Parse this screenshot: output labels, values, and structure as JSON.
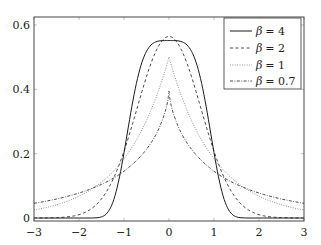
{
  "chart_data": {
    "type": "line",
    "title": "",
    "xlabel": "",
    "ylabel": "",
    "xlim": [
      -3,
      3
    ],
    "ylim": [
      -0.01,
      0.61
    ],
    "grid": false,
    "legend_position": "upper right (inside)",
    "x_ticks": [
      -3,
      -2,
      -1,
      0,
      1,
      2,
      3
    ],
    "x_tick_labels": [
      "−3",
      "−2",
      "−1",
      "0",
      "1",
      "2",
      "3"
    ],
    "y_ticks": [
      0,
      0.2,
      0.4,
      0.6
    ],
    "y_tick_labels": [
      "0",
      "0.2",
      "0.4",
      "0.6"
    ],
    "x": [
      -3.0,
      -2.9,
      -2.8,
      -2.7,
      -2.6,
      -2.5,
      -2.4,
      -2.3,
      -2.2,
      -2.1,
      -2.0,
      -1.9,
      -1.8,
      -1.7,
      -1.6,
      -1.5,
      -1.4,
      -1.3,
      -1.2,
      -1.1,
      -1.0,
      -0.9,
      -0.8,
      -0.7,
      -0.6,
      -0.5,
      -0.4,
      -0.3,
      -0.2,
      -0.1,
      -0.05,
      -0.02,
      0.0,
      0.02,
      0.05,
      0.1,
      0.2,
      0.3,
      0.4,
      0.5,
      0.6,
      0.7,
      0.8,
      0.9,
      1.0,
      1.1,
      1.2,
      1.3,
      1.4,
      1.5,
      1.6,
      1.7,
      1.8,
      1.9,
      2.0,
      2.1,
      2.2,
      2.3,
      2.4,
      2.5,
      2.6,
      2.7,
      2.8,
      2.9,
      3.0
    ],
    "series": [
      {
        "name": "β = 4",
        "legend_symbol": "β",
        "legend_value": "= 4",
        "style": "solid",
        "values": [
          0,
          0,
          0,
          0,
          0,
          0,
          0,
          0,
          0,
          0,
          0,
          0,
          0,
          0.0001,
          0.0008,
          0.0035,
          0.0118,
          0.0317,
          0.0693,
          0.1277,
          0.2029,
          0.2862,
          0.366,
          0.4338,
          0.4846,
          0.5182,
          0.5377,
          0.5471,
          0.5507,
          0.5515,
          0.5516,
          0.5516,
          0.5516,
          0.5516,
          0.5516,
          0.5515,
          0.5507,
          0.5471,
          0.5377,
          0.5182,
          0.4846,
          0.4338,
          0.366,
          0.2862,
          0.2029,
          0.1277,
          0.0693,
          0.0317,
          0.0118,
          0.0035,
          0.0008,
          0.0001,
          0,
          0,
          0,
          0,
          0,
          0,
          0,
          0,
          0,
          0,
          0,
          0,
          0
        ]
      },
      {
        "name": "β = 2",
        "legend_symbol": "β",
        "legend_value": "= 2",
        "style": "dashed",
        "values": [
          0.0001,
          0.0001,
          0.0002,
          0.0004,
          0.0007,
          0.0011,
          0.0018,
          0.0028,
          0.0045,
          0.0068,
          0.0103,
          0.0152,
          0.0221,
          0.0314,
          0.0436,
          0.0595,
          0.0794,
          0.104,
          0.1337,
          0.1682,
          0.2076,
          0.251,
          0.2975,
          0.3455,
          0.3936,
          0.4394,
          0.4808,
          0.5157,
          0.5421,
          0.5586,
          0.5628,
          0.564,
          0.5642,
          0.564,
          0.5628,
          0.5586,
          0.5421,
          0.5157,
          0.4808,
          0.4394,
          0.3936,
          0.3455,
          0.2975,
          0.251,
          0.2076,
          0.1682,
          0.1337,
          0.104,
          0.0794,
          0.0595,
          0.0436,
          0.0314,
          0.0221,
          0.0152,
          0.0103,
          0.0068,
          0.0045,
          0.0028,
          0.0018,
          0.0011,
          0.0007,
          0.0004,
          0.0002,
          0.0001,
          0.0001
        ]
      },
      {
        "name": "β = 1",
        "legend_symbol": "β",
        "legend_value": "= 1",
        "style": "dotted",
        "values": [
          0.0249,
          0.0275,
          0.0304,
          0.0336,
          0.0371,
          0.041,
          0.0454,
          0.0501,
          0.0554,
          0.0612,
          0.0677,
          0.0748,
          0.0826,
          0.0913,
          0.1009,
          0.1116,
          0.1233,
          0.1363,
          0.1506,
          0.1664,
          0.1839,
          0.2033,
          0.2247,
          0.2483,
          0.2744,
          0.3033,
          0.3352,
          0.3704,
          0.4094,
          0.4524,
          0.4756,
          0.4901,
          0.5,
          0.4901,
          0.4756,
          0.4524,
          0.4094,
          0.3704,
          0.3352,
          0.3033,
          0.2744,
          0.2483,
          0.2247,
          0.2033,
          0.1839,
          0.1664,
          0.1506,
          0.1363,
          0.1233,
          0.1116,
          0.1009,
          0.0913,
          0.0826,
          0.0748,
          0.0677,
          0.0612,
          0.0554,
          0.0501,
          0.0454,
          0.041,
          0.0371,
          0.0336,
          0.0304,
          0.0275,
          0.0249
        ]
      },
      {
        "name": "β = 0.7",
        "legend_symbol": "β",
        "legend_value": "= 0.7",
        "style": "dashdot",
        "values": [
          0.0457,
          0.048,
          0.0505,
          0.0532,
          0.056,
          0.059,
          0.0622,
          0.0657,
          0.0694,
          0.0733,
          0.0776,
          0.0822,
          0.0871,
          0.0928,
          0.0984,
          0.1046,
          0.1114,
          0.1188,
          0.1268,
          0.1356,
          0.1453,
          0.1566,
          0.1686,
          0.1818,
          0.1966,
          0.2137,
          0.2334,
          0.2569,
          0.286,
          0.3236,
          0.3493,
          0.3702,
          0.395,
          0.3702,
          0.3493,
          0.3236,
          0.286,
          0.2569,
          0.2334,
          0.2137,
          0.1966,
          0.1818,
          0.1686,
          0.1566,
          0.1453,
          0.1356,
          0.1268,
          0.1188,
          0.1114,
          0.1046,
          0.0984,
          0.0928,
          0.0871,
          0.0822,
          0.0776,
          0.0733,
          0.0694,
          0.0657,
          0.0622,
          0.059,
          0.056,
          0.0532,
          0.0505,
          0.048,
          0.0457
        ]
      }
    ]
  },
  "colors": {
    "line": "#1a1a1a",
    "axis": "#333333",
    "background": "#ffffff"
  }
}
